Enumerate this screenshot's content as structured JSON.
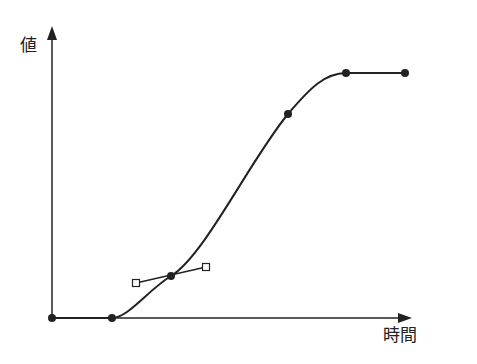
{
  "axes": {
    "y_label": "値",
    "x_label": "時間",
    "color": "#222222"
  },
  "curve": {
    "points": [
      {
        "x": 52,
        "y": 318
      },
      {
        "x": 112,
        "y": 318
      },
      {
        "x": 171,
        "y": 276
      },
      {
        "x": 288,
        "y": 114
      },
      {
        "x": 346,
        "y": 73
      },
      {
        "x": 405,
        "y": 73
      }
    ],
    "tangent_handles": [
      {
        "x": 136,
        "y": 283
      },
      {
        "x": 206,
        "y": 267
      }
    ],
    "color": "#222222"
  }
}
